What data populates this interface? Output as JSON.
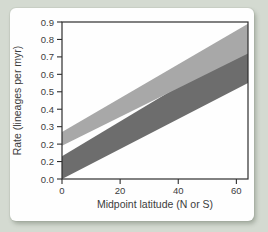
{
  "figure": {
    "background_color": "#d4dad1",
    "panel_color": "#fefefe"
  },
  "chart_data": {
    "type": "area",
    "title": "",
    "xlabel": "Midpoint latitude (N or S)",
    "ylabel": "Rate (lineages per myr)",
    "xlim": [
      0,
      64
    ],
    "ylim": [
      0,
      0.9
    ],
    "grid": false,
    "legend": "none",
    "axis_color": "#2e2e2e",
    "text_color": "#3c3c3c",
    "x_ticks": [
      {
        "value": 0,
        "label": "0"
      },
      {
        "value": 20,
        "label": "20"
      },
      {
        "value": 40,
        "label": "40"
      },
      {
        "value": 60,
        "label": "60"
      }
    ],
    "y_ticks": [
      {
        "value": 0.0,
        "label": "0.0"
      },
      {
        "value": 0.1,
        "label": "0.2"
      },
      {
        "value": 0.2,
        "label": "0.2"
      },
      {
        "value": 0.3,
        "label": "0.3"
      },
      {
        "value": 0.4,
        "label": "0.4"
      },
      {
        "value": 0.5,
        "label": "0.5"
      },
      {
        "value": 0.6,
        "label": "0.6"
      },
      {
        "value": 0.7,
        "label": "0.7"
      },
      {
        "value": 0.8,
        "label": "0.8"
      },
      {
        "value": 0.9,
        "label": "0.9"
      }
    ],
    "series": [
      {
        "name": "dark-gray-band",
        "band": true,
        "color": "#6d6d6d",
        "x": [
          0,
          64
        ],
        "low": [
          0.0,
          0.55
        ],
        "high": [
          0.13,
          0.77
        ]
      },
      {
        "name": "light-gray-band",
        "band": true,
        "color": "#a8a8a8",
        "x": [
          0,
          64
        ],
        "low": [
          0.19,
          0.72
        ],
        "high": [
          0.27,
          0.89
        ]
      }
    ]
  }
}
